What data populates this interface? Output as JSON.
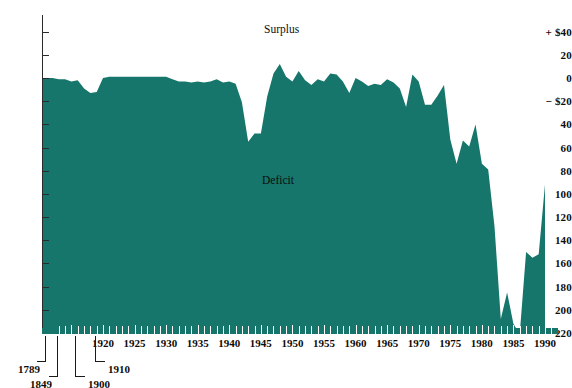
{
  "chart_data": {
    "type": "area",
    "title": "",
    "xlabel": "",
    "ylabel": "",
    "annotations": [
      {
        "text": "Surplus",
        "x": 1948,
        "y": 30
      },
      {
        "text": "Deficit",
        "x": 1948,
        "y": -90
      }
    ],
    "series_color": "#16766b",
    "y_axis": {
      "label_top": "+ $40",
      "label_zero_neg": "− $20",
      "ticks": [
        40,
        20,
        0,
        -20,
        -40,
        -60,
        -80,
        -100,
        -120,
        -140,
        -160,
        -180,
        -200,
        -220
      ],
      "tick_labels": [
        "+ $40",
        "20",
        "0",
        "− $20",
        "40",
        "60",
        "80",
        "100",
        "120",
        "140",
        "160",
        "180",
        "200",
        "220"
      ],
      "ylim": [
        -220,
        40
      ],
      "units": "billions of dollars"
    },
    "x_axis": {
      "tick_labels": [
        "1920",
        "1925",
        "1930",
        "1935",
        "1940",
        "1945",
        "1950",
        "1955",
        "1960",
        "1965",
        "1970",
        "1975",
        "1980",
        "1985",
        "1990"
      ],
      "leader_labels": [
        "1789",
        "1849",
        "1900",
        "1910"
      ],
      "xlim": [
        1912,
        1991
      ],
      "grid": false
    },
    "x": [
      1912,
      1913,
      1914,
      1915,
      1916,
      1917,
      1918,
      1919,
      1920,
      1921,
      1922,
      1923,
      1924,
      1925,
      1926,
      1927,
      1928,
      1929,
      1930,
      1931,
      1932,
      1933,
      1934,
      1935,
      1936,
      1937,
      1938,
      1939,
      1940,
      1941,
      1942,
      1943,
      1944,
      1945,
      1946,
      1947,
      1948,
      1949,
      1950,
      1951,
      1952,
      1953,
      1954,
      1955,
      1956,
      1957,
      1958,
      1959,
      1960,
      1961,
      1962,
      1963,
      1964,
      1965,
      1966,
      1967,
      1968,
      1969,
      1970,
      1971,
      1972,
      1973,
      1974,
      1975,
      1976,
      1977,
      1978,
      1979,
      1980,
      1981,
      1982,
      1983,
      1984,
      1985,
      1986,
      1987,
      1988,
      1989,
      1990
    ],
    "values": [
      0,
      -1,
      -1,
      -3,
      -2,
      -9,
      -13,
      -12,
      0,
      1,
      1,
      1,
      1,
      1,
      1,
      1,
      1,
      1,
      1,
      -1,
      -3,
      -3,
      -4,
      -3,
      -4,
      -3,
      -1,
      -4,
      -3,
      -5,
      -21,
      -55,
      -48,
      -48,
      -16,
      4,
      12,
      1,
      -3,
      6,
      -2,
      -6,
      -1,
      -3,
      4,
      3,
      -3,
      -13,
      0,
      -3,
      -7,
      -5,
      -6,
      -1,
      -4,
      -9,
      -25,
      3,
      -3,
      -23,
      -23,
      -15,
      -6,
      -53,
      -74,
      -54,
      -59,
      -40,
      -74,
      -79,
      -128,
      -208,
      -185,
      -212,
      -221,
      -150,
      -155,
      -152,
      -92
    ]
  },
  "axis_labels": {
    "y": [
      "+ $40",
      "20",
      "0",
      "− $20",
      "40",
      "60",
      "80",
      "100",
      "120",
      "140",
      "160",
      "180",
      "200",
      "220"
    ],
    "x": [
      "1920",
      "1925",
      "1930",
      "1935",
      "1940",
      "1945",
      "1950",
      "1955",
      "1960",
      "1965",
      "1970",
      "1975",
      "1980",
      "1985",
      "1990"
    ],
    "leaders": [
      "1789",
      "1849",
      "1900",
      "1910"
    ]
  },
  "annotations": {
    "surplus": "Surplus",
    "deficit": "Deficit"
  },
  "colors": {
    "area": "#16766b",
    "axis": "#2b2b2b",
    "text": "#100c08",
    "background": "#ffffff"
  }
}
